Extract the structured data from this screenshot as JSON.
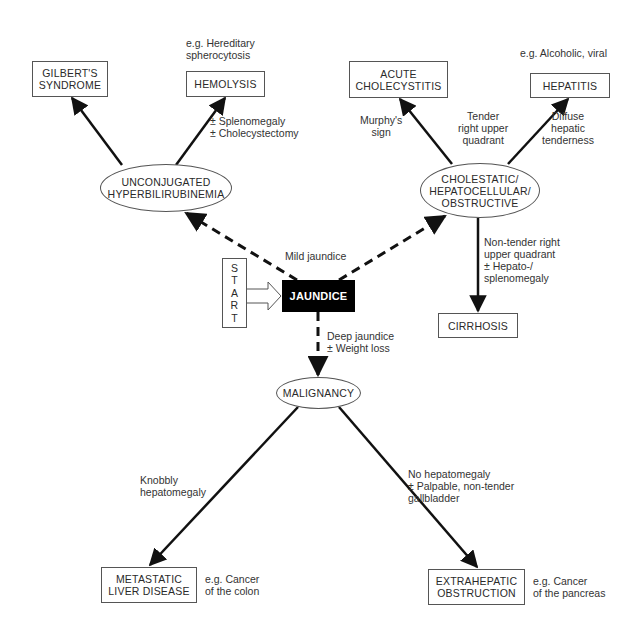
{
  "diagram": {
    "colors": {
      "line": "#111111",
      "box_border": "#555555",
      "start_node_fill": "#000000",
      "text": "#2a2a2a"
    },
    "nodes": {
      "start": {
        "letters": [
          "S",
          "T",
          "A",
          "R",
          "T"
        ],
        "shape": "rectangle"
      },
      "jaundice": {
        "label": "JAUNDICE",
        "shape": "rectangle-filled"
      },
      "unconjugated": {
        "label": "UNCONJUGATED\nHYPERBILIRUBINEMIA",
        "shape": "ellipse"
      },
      "cholestatic": {
        "label": "CHOLESTATIC/\nHEPATOCELLULAR/\nOBSTRUCTIVE",
        "shape": "ellipse"
      },
      "malignancy": {
        "label": "MALIGNANCY",
        "shape": "ellipse"
      },
      "gilbert": {
        "label": "GILBERT'S\nSYNDROME",
        "shape": "rectangle"
      },
      "hemolysis": {
        "label": "HEMOLYSIS",
        "shape": "rectangle"
      },
      "acute_cholecystitis": {
        "label": "ACUTE\nCHOLECYSTITIS",
        "shape": "rectangle"
      },
      "hepatitis": {
        "label": "HEPATITIS",
        "shape": "rectangle"
      },
      "cirrhosis": {
        "label": "CIRRHOSIS",
        "shape": "rectangle"
      },
      "metastatic": {
        "label": "METASTATIC\nLIVER DISEASE",
        "shape": "rectangle"
      },
      "extrahepatic": {
        "label": "EXTRAHEPATIC\nOBSTRUCTION",
        "shape": "rectangle"
      }
    },
    "annotations": {
      "hemolysis_example": "e.g. Hereditary\nspherocytosis",
      "hemolysis_edge": "± Splenomegaly\n± Cholecystectomy",
      "hepatitis_example": "e.g. Alcoholic, viral",
      "cholecystitis_edge": "Murphy's\nsign",
      "tender_ruq": "Tender\nright upper\nquadrant",
      "hepatitis_edge": "Diffuse\nhepatic\ntenderness",
      "mild_jaundice": "Mild jaundice",
      "cirrhosis_edge": "Non-tender right\nupper quadrant\n± Hepato-/\nsplenomegaly",
      "deep_jaundice": "Deep jaundice\n± Weight loss",
      "metastatic_edge": "Knobbly\nhepatomegaly",
      "extrahepatic_edge": "No hepatomegaly\n± Palpable, non-tender\ngallbladder",
      "metastatic_example": "e.g. Cancer\nof the colon",
      "extrahepatic_example": "e.g. Cancer\nof the pancreas"
    },
    "edges": [
      {
        "from": "start",
        "to": "jaundice",
        "style": "hollow-arrow"
      },
      {
        "from": "jaundice",
        "to": "unconjugated",
        "style": "dashed",
        "label": "Mild jaundice"
      },
      {
        "from": "jaundice",
        "to": "cholestatic",
        "style": "dashed",
        "label": "Mild jaundice"
      },
      {
        "from": "jaundice",
        "to": "malignancy",
        "style": "dashed",
        "label": "Deep jaundice ± Weight loss"
      },
      {
        "from": "unconjugated",
        "to": "gilbert",
        "style": "solid"
      },
      {
        "from": "unconjugated",
        "to": "hemolysis",
        "style": "solid",
        "label": "± Splenomegaly ± Cholecystectomy"
      },
      {
        "from": "cholestatic",
        "to": "acute_cholecystitis",
        "style": "solid",
        "label": "Murphy's sign"
      },
      {
        "from": "cholestatic",
        "to": "hepatitis",
        "style": "solid",
        "label": "Diffuse hepatic tenderness"
      },
      {
        "from": "cholestatic",
        "to": "cirrhosis",
        "style": "solid",
        "label": "Non-tender right upper quadrant ± Hepato-/splenomegaly"
      },
      {
        "from": "malignancy",
        "to": "metastatic",
        "style": "solid",
        "label": "Knobbly hepatomegaly"
      },
      {
        "from": "malignancy",
        "to": "extrahepatic",
        "style": "solid",
        "label": "No hepatomegaly ± Palpable, non-tender gallbladder"
      }
    ]
  }
}
